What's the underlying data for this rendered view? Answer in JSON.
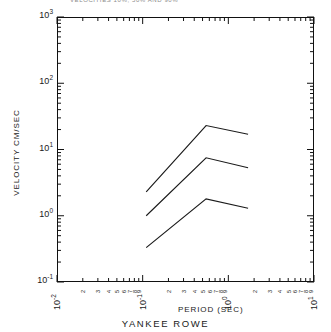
{
  "figure": {
    "title_fragment": "VELOCITIES     10%, 50% AND  90%",
    "caption": "YANKEE ROWE"
  },
  "axes": {
    "y_label": "VELOCITY CM/SEC",
    "x_label": "PERIOD (SEC)",
    "y_decade_labels": [
      "10",
      "10",
      "10",
      "10",
      "10"
    ],
    "y_decade_exponents": [
      "3",
      "2",
      "1",
      "0",
      "-1"
    ],
    "x_decade_labels": [
      "10",
      "10",
      "10",
      "10"
    ],
    "x_decade_exponents": [
      "-2",
      "-1",
      "0",
      "1"
    ],
    "minor_tick_labels": [
      "2",
      "3",
      "4",
      "5",
      "6",
      "7",
      "8",
      "9"
    ]
  },
  "chart_data": {
    "type": "line",
    "title": "VELOCITIES     10%, 50% AND  90%",
    "subtitle": "YANKEE ROWE",
    "xlabel": "PERIOD (SEC)",
    "ylabel": "VELOCITY CM/SEC",
    "xscale": "log",
    "yscale": "log",
    "xlim": [
      0.01,
      10
    ],
    "ylim": [
      0.1,
      1000
    ],
    "grid": false,
    "legend": "none",
    "x_tick_labels": [
      "10^-2",
      "10^-1",
      "10^0",
      "10^1"
    ],
    "y_tick_labels": [
      "10^-1",
      "10^0",
      "10^1",
      "10^2",
      "10^3"
    ],
    "series": [
      {
        "name": "90%",
        "x": [
          0.11,
          0.55,
          1.7
        ],
        "y": [
          2.3,
          23.0,
          17.0
        ]
      },
      {
        "name": "50%",
        "x": [
          0.11,
          0.55,
          1.7
        ],
        "y": [
          1.0,
          7.5,
          5.3
        ]
      },
      {
        "name": "10%",
        "x": [
          0.11,
          0.55,
          1.7
        ],
        "y": [
          0.33,
          1.8,
          1.3
        ]
      }
    ]
  }
}
